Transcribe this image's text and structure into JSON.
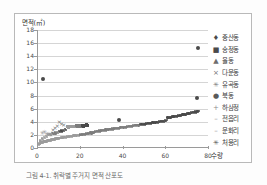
{
  "figure": {
    "caption": "그림 4-1. 취락별 주거지 면적 산포도"
  },
  "chart_data": {
    "type": "scatter",
    "title": "",
    "ylabel": "면적(㎡)",
    "xlabel": "수량",
    "xlim": [
      0,
      80
    ],
    "ylim": [
      0,
      18
    ],
    "xticks": [
      0,
      20,
      40,
      60,
      80
    ],
    "yticks": [
      0,
      2,
      4,
      6,
      8,
      10,
      12,
      14,
      16,
      18
    ],
    "grid": true,
    "legend_position": "right",
    "legend": [
      {
        "label": "중산동",
        "marker": "diamond",
        "color": "#4a4a4a"
      },
      {
        "label": "송정동",
        "marker": "square",
        "color": "#4a4a4a"
      },
      {
        "label": "율동",
        "marker": "triangle",
        "color": "#6e6e6e"
      },
      {
        "label": "다운동",
        "marker": "x",
        "color": "#6e6e6e"
      },
      {
        "label": "유곡동",
        "marker": "asterisk",
        "color": "#7d7d7d"
      },
      {
        "label": "북동",
        "marker": "circle",
        "color": "#5a5a5a"
      },
      {
        "label": "하삼정",
        "marker": "plus",
        "color": "#8d8d8d"
      },
      {
        "label": "전읍리",
        "marker": "dash",
        "color": "#8d8d8d"
      },
      {
        "label": "운화리",
        "marker": "dash",
        "color": "#8d8d8d"
      },
      {
        "label": "처용리",
        "marker": "asterisk",
        "color": "#5a5a5a"
      }
    ],
    "series": [
      {
        "name": "하삼정",
        "marker": "plus",
        "color": "#5a5a5a",
        "note": "주된 밀집 계열 — 0~75 수량 구간에서 0.6㎡에서 5.6㎡까지 완만히 증가",
        "points": [
          [
            0.5,
            0.6
          ],
          [
            1,
            0.7
          ],
          [
            1.5,
            0.8
          ],
          [
            2,
            0.85
          ],
          [
            2.5,
            0.9
          ],
          [
            3,
            0.95
          ],
          [
            3.5,
            1.0
          ],
          [
            4,
            1.05
          ],
          [
            4.5,
            1.1
          ],
          [
            5,
            1.15
          ],
          [
            5.5,
            1.2
          ],
          [
            6,
            1.22
          ],
          [
            6.5,
            1.25
          ],
          [
            7,
            1.3
          ],
          [
            7.5,
            1.32
          ],
          [
            8,
            1.35
          ],
          [
            8.5,
            1.4
          ],
          [
            9,
            1.42
          ],
          [
            9.5,
            1.45
          ],
          [
            10,
            1.5
          ],
          [
            11,
            1.55
          ],
          [
            12,
            1.6
          ],
          [
            13,
            1.65
          ],
          [
            14,
            1.7
          ],
          [
            15,
            1.75
          ],
          [
            16,
            1.8
          ],
          [
            17,
            1.85
          ],
          [
            18,
            1.9
          ],
          [
            19,
            1.95
          ],
          [
            20,
            2.0
          ],
          [
            21,
            2.05
          ],
          [
            22,
            2.1
          ],
          [
            23,
            2.15
          ],
          [
            24,
            2.2
          ],
          [
            25,
            2.3
          ],
          [
            26,
            2.4
          ],
          [
            27,
            2.5
          ],
          [
            28,
            2.55
          ],
          [
            29,
            2.6
          ],
          [
            30,
            2.65
          ],
          [
            31,
            2.7
          ],
          [
            32,
            2.75
          ],
          [
            33,
            2.8
          ],
          [
            34,
            2.85
          ],
          [
            35,
            2.9
          ],
          [
            36,
            2.95
          ],
          [
            37,
            3.0
          ],
          [
            38,
            3.05
          ],
          [
            39,
            3.1
          ],
          [
            40,
            3.15
          ],
          [
            41,
            3.2
          ],
          [
            42,
            3.25
          ],
          [
            43,
            3.3
          ],
          [
            44,
            3.35
          ],
          [
            45,
            3.4
          ],
          [
            46,
            3.45
          ],
          [
            47,
            3.5
          ],
          [
            48,
            3.55
          ],
          [
            49,
            3.6
          ],
          [
            50,
            3.65
          ],
          [
            51,
            3.7
          ],
          [
            52,
            3.75
          ],
          [
            53,
            3.8
          ],
          [
            54,
            3.85
          ],
          [
            55,
            3.9
          ],
          [
            56,
            3.95
          ],
          [
            57,
            4.0
          ],
          [
            58,
            4.05
          ],
          [
            59,
            4.1
          ],
          [
            60,
            4.2
          ],
          [
            61,
            4.6
          ],
          [
            62,
            4.7
          ],
          [
            63,
            4.75
          ],
          [
            64,
            4.8
          ],
          [
            65,
            4.85
          ],
          [
            66,
            4.9
          ],
          [
            67,
            5.0
          ],
          [
            68,
            5.05
          ],
          [
            69,
            5.1
          ],
          [
            70,
            5.2
          ],
          [
            71,
            5.3
          ],
          [
            72,
            5.4
          ],
          [
            73,
            5.45
          ],
          [
            74,
            5.5
          ],
          [
            75,
            5.6
          ]
        ]
      },
      {
        "name": "중산동",
        "marker": "diamond",
        "color": "#4a4a4a",
        "points": [
          [
            2.5,
            10.6
          ],
          [
            75,
            15.3
          ],
          [
            74.5,
            7.7
          ],
          [
            38,
            4.2
          ]
        ]
      },
      {
        "name": "송정동",
        "marker": "square",
        "color": "#5a5a5a",
        "note": "14~23 수량 구간, 3.2~3.5㎡ 수평 밴드",
        "points": [
          [
            14,
            3.2
          ],
          [
            15,
            3.25
          ],
          [
            16,
            3.3
          ],
          [
            17,
            3.3
          ],
          [
            18,
            3.35
          ],
          [
            19,
            3.35
          ],
          [
            20,
            3.4
          ],
          [
            21,
            3.4
          ],
          [
            22,
            3.45
          ],
          [
            23,
            3.5
          ]
        ]
      },
      {
        "name": "다운동",
        "marker": "x",
        "color": "#777777",
        "points": [
          [
            10,
            4.0
          ],
          [
            11,
            3.7
          ],
          [
            12,
            3.5
          ],
          [
            9,
            3.3
          ],
          [
            8,
            3.0
          ],
          [
            7,
            2.8
          ]
        ]
      },
      {
        "name": "율동",
        "marker": "triangle",
        "color": "#8a8a8a",
        "points": [
          [
            1,
            1.2
          ],
          [
            2,
            1.4
          ],
          [
            3,
            1.6
          ],
          [
            4,
            1.8
          ],
          [
            5,
            2.0
          ],
          [
            6,
            2.1
          ],
          [
            7,
            2.2
          ],
          [
            8,
            2.3
          ],
          [
            9,
            2.4
          ],
          [
            10,
            2.5
          ],
          [
            11,
            2.6
          ],
          [
            12,
            2.7
          ],
          [
            13,
            2.8
          ]
        ]
      },
      {
        "name": "유곡동",
        "marker": "asterisk",
        "color": "#9b9b9b",
        "points": [
          [
            2,
            2.3
          ],
          [
            3,
            2.4
          ],
          [
            4,
            2.2
          ],
          [
            5,
            2.1
          ],
          [
            6,
            2.0
          ]
        ]
      }
    ],
    "annotations": [
      {
        "text": "최대 이상치",
        "x": 75,
        "y": 15.3
      },
      {
        "text": "좌측 이상치",
        "x": 2.5,
        "y": 10.6
      }
    ]
  }
}
